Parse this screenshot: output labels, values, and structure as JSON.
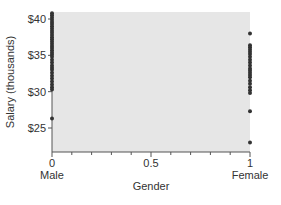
{
  "chart_data": {
    "type": "scatter",
    "title": "",
    "xlabel": "Gender",
    "ylabel": "Salary (thousands)",
    "xlim": [
      0,
      1
    ],
    "ylim": [
      22,
      41.2
    ],
    "grid": false,
    "legend": null,
    "x_ticks": [
      {
        "value": 0,
        "label": "0",
        "sublabel": "Male"
      },
      {
        "value": 0.5,
        "label": "0.5",
        "sublabel": ""
      },
      {
        "value": 1,
        "label": "1",
        "sublabel": "Female"
      }
    ],
    "x_minor_ticks": [
      0.1,
      0.2,
      0.3,
      0.4,
      0.6,
      0.7,
      0.8,
      0.9
    ],
    "y_ticks": [
      {
        "value": 25,
        "label": "$25"
      },
      {
        "value": 30,
        "label": "$30"
      },
      {
        "value": 35,
        "label": "$35"
      },
      {
        "value": 40,
        "label": "$40"
      }
    ],
    "series": [
      {
        "name": "Male",
        "x": 0,
        "values": [
          40.8,
          40.5,
          40.2,
          39.9,
          39.6,
          39.3,
          39.0,
          38.7,
          38.4,
          38.1,
          37.8,
          37.5,
          37.2,
          36.9,
          36.6,
          36.3,
          36.0,
          35.7,
          35.4,
          35.1,
          34.8,
          34.4,
          34.0,
          33.6,
          33.3,
          33.0,
          32.6,
          32.2,
          31.8,
          31.4,
          31.0,
          30.6,
          30.3,
          26.3
        ]
      },
      {
        "name": "Female",
        "x": 1,
        "values": [
          38.0,
          36.4,
          36.1,
          35.8,
          35.5,
          35.2,
          34.8,
          34.4,
          34.0,
          33.6,
          33.2,
          32.9,
          32.6,
          32.3,
          32.0,
          31.5,
          31.1,
          30.6,
          30.2,
          29.8,
          27.3,
          23.0
        ]
      }
    ],
    "colors": {
      "plot_background": "#e6e6e6",
      "marker": "#333333",
      "axis": "#555555"
    }
  }
}
